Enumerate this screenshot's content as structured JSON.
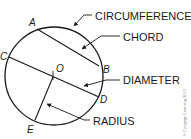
{
  "diagram": {
    "type": "circle-parts",
    "colors": {
      "stroke": "#1a1a1a",
      "background": "#ffffff",
      "copyright": "#8a8a8a"
    },
    "circle": {
      "cx": 54,
      "cy": 76,
      "r": 49
    },
    "points": {
      "A": {
        "label": "A",
        "x": 37,
        "y": 30
      },
      "B": {
        "label": "B",
        "x": 99,
        "y": 66
      },
      "C": {
        "label": "C",
        "x": 9,
        "y": 58
      },
      "D": {
        "label": "D",
        "x": 99,
        "y": 97
      },
      "O": {
        "label": "O",
        "x": 53,
        "y": 77
      },
      "E": {
        "label": "E",
        "x": 34,
        "y": 120
      }
    },
    "segments": [
      {
        "name": "chord",
        "from": "A",
        "to": "B"
      },
      {
        "name": "diameter",
        "from": "C",
        "to": "D"
      },
      {
        "name": "radius",
        "from": "O",
        "to": "E"
      }
    ],
    "callouts": {
      "circumference": "CIRCUMFERENCE",
      "chord": "CHORD",
      "diameter": "DIAMETER",
      "radius": "RADIUS"
    },
    "copyright": "© Cengage Learning 2013"
  }
}
